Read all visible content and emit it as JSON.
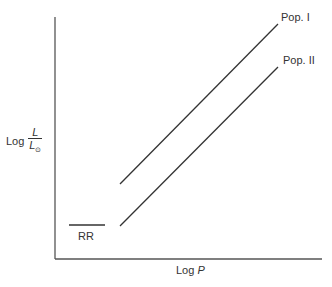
{
  "diagram": {
    "y_axis_label": {
      "prefix": "Log",
      "numerator": "L",
      "denominator": "L",
      "denominator_subscript": "⊙"
    },
    "x_axis_label": {
      "prefix": "Log",
      "variable": "P"
    },
    "lines": [
      {
        "name": "Pop. I",
        "label": "Pop. I"
      },
      {
        "name": "Pop. II",
        "label": "Pop. II"
      },
      {
        "name": "RR",
        "label": "RR"
      }
    ],
    "line_color": "#333333"
  }
}
